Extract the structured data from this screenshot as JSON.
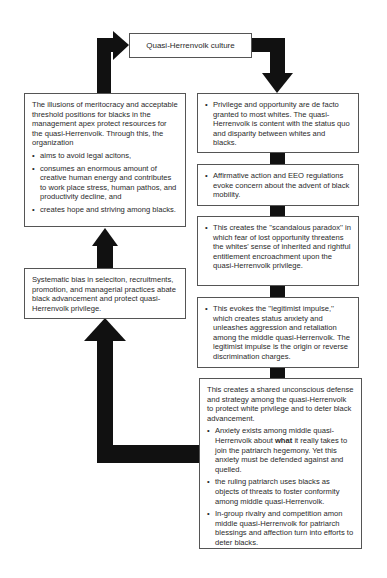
{
  "top": {
    "title": "Quasi-Herrenvolk culture"
  },
  "left": {
    "box1": {
      "intro": "The illusions of meritocracy and acceptable threshold positions for blacks in the management apex protect resources for the quasi-Herrenvolk. Through this, the organization",
      "bullets": [
        "aims to avoid legal acitons,",
        "consumes an enormous amount of creative human energy and contributes to work place stress, human pathos, and productivity decline, and",
        "creates hope and striving among blacks."
      ]
    },
    "box2": {
      "text": "Systematic bias in seleciton, recruitments, promotion, and managerial practices abate black advancement and protect quasi-Herrenvolk privilege."
    }
  },
  "right": {
    "box1": {
      "bullet": "Privilege and opportunity are de facto granted to most whites. The quasi-Herrenvolk is content with the status quo and disparity between whites and blacks."
    },
    "box2": {
      "bullet": "Affirmative action and EEO regulations evoke concern about the advent of black mobility."
    },
    "box3": {
      "bullet": "This creates the ''scandalous paradox'' in which fear of lost opportunity threatens the whites' sense of inherited and rightful entitlement encroachment upon the quasi-Herrenvolk privilege."
    },
    "box4": {
      "bullet": "This evokes the ''legitimist impulse,'' which creates status anxiety and unleashes aggression and retaliation among the middle quasi-Herrenvolk. The legitimist impulse is the origin or reverse discrimination charges."
    },
    "box5": {
      "intro": "This creates a shared unconscious defense and strategy among the quasi-Herrenvolk to protect white privilege and to deter black advancement.",
      "bullet1_pre": "Anxiety exists among middle quasi-Herrenvolk about ",
      "bullet1_bold": "what",
      "bullet1_post": " it really takes to join the patriarch hegemony. Yet this anxiety must be defended against and quelled.",
      "bullets": [
        "the ruling patriarch uses blacks as objects of threats to foster conformity among middle quasi-Herrenvolk.",
        "In-group rivalry and competition amon middle quasi-Herrenvolk for patriarch blessings and affection turn into efforts to deter blacks."
      ]
    }
  },
  "colors": {
    "arrow": "#111111",
    "border": "#555555",
    "text": "#2a2a2a"
  }
}
